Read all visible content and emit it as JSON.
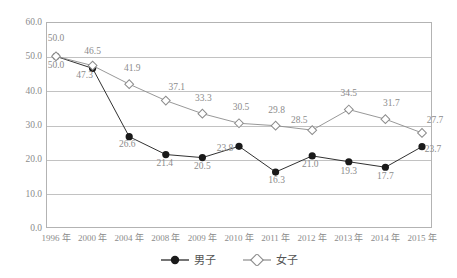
{
  "chart_data": {
    "type": "line",
    "title": "",
    "subtitle": "",
    "xlabel": "",
    "ylabel": "",
    "categories": [
      "1996 年",
      "2000 年",
      "2004 年",
      "2008 年",
      "2009 年",
      "2010 年",
      "2011 年",
      "2012 年",
      "2013 年",
      "2014 年",
      "2015 年"
    ],
    "series": [
      {
        "name": "男子",
        "marker": "filled-circle",
        "color": "#1a1a1a",
        "values": [
          50.0,
          46.5,
          26.6,
          21.4,
          20.5,
          23.8,
          16.3,
          21.0,
          19.3,
          17.7,
          23.7
        ],
        "labels": [
          "50.0",
          "46.5",
          "26.6",
          "21.4",
          "20.5",
          "23.8",
          "16.3",
          "21.0",
          "19.3",
          "17.7",
          "23.7"
        ]
      },
      {
        "name": "女子",
        "marker": "open-diamond",
        "color": "#8c8c8c",
        "values": [
          50.0,
          47.3,
          41.9,
          37.1,
          33.3,
          30.5,
          29.8,
          28.5,
          34.5,
          31.7,
          27.7
        ],
        "labels": [
          "50.0",
          "47.3",
          "41.9",
          "37.1",
          "33.3",
          "30.5",
          "29.8",
          "28.5",
          "34.5",
          "31.7",
          "27.7"
        ]
      }
    ],
    "yticks": [
      "60.0",
      "50.0",
      "40.0",
      "30.0",
      "20.0",
      "10.0",
      "0.0"
    ],
    "ylim": [
      0,
      60
    ],
    "ytick_step": 10,
    "grid": true,
    "legend_position": "bottom-center",
    "legend": [
      "男子",
      "女子"
    ]
  },
  "legend": {
    "entries": [
      {
        "label": "男子",
        "marker": "filled-circle-marker-icon"
      },
      {
        "label": "女子",
        "marker": "open-diamond-marker-icon"
      }
    ]
  },
  "colors": {
    "male_series": "#1a1a1a",
    "female_series": "#8c8c8c",
    "gridline": "#c2c2c2",
    "frame": "#b3b3b3",
    "text": "#8c8c8c",
    "background": "#ffffff"
  }
}
